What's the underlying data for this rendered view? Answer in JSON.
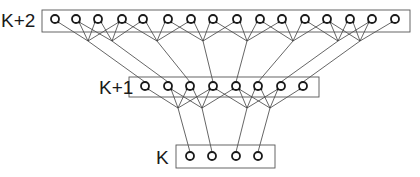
{
  "diagram": {
    "type": "layered-network",
    "layers": [
      {
        "id": "top",
        "label": "K+2",
        "label_pos": [
          1,
          27
        ],
        "box": [
          42,
          10,
          368,
          22
        ],
        "node_y": 19,
        "nodes_x": [
          55,
          76,
          98,
          122,
          143,
          168,
          191,
          213,
          237,
          260,
          282,
          305,
          327,
          350,
          372,
          395
        ]
      },
      {
        "id": "middle",
        "label": "K+1",
        "label_pos": [
          99,
          94
        ],
        "box": [
          129,
          77,
          190,
          20
        ],
        "node_y": 86,
        "nodes_x": [
          145,
          168,
          190,
          213,
          236,
          258,
          281,
          303
        ]
      },
      {
        "id": "bottom",
        "label": "K",
        "label_pos": [
          156,
          164
        ],
        "box": [
          176,
          145,
          99,
          23
        ],
        "node_y": 156,
        "nodes_x": [
          190,
          212,
          236,
          258
        ]
      }
    ],
    "hubs_upper": {
      "y": 41,
      "points": [
        {
          "x": 88,
          "sources": [
            0,
            1,
            2,
            3
          ],
          "target": 0
        },
        {
          "x": 112,
          "sources": [
            1,
            2,
            3,
            4
          ],
          "target": 1
        },
        {
          "x": 157,
          "sources": [
            3,
            4,
            5,
            6
          ],
          "target": 2
        },
        {
          "x": 203,
          "sources": [
            5,
            6,
            7,
            8
          ],
          "target": 3
        },
        {
          "x": 247,
          "sources": [
            7,
            8,
            9,
            10
          ],
          "target": 4
        },
        {
          "x": 293,
          "sources": [
            9,
            10,
            11,
            12
          ],
          "target": 5
        },
        {
          "x": 338,
          "sources": [
            11,
            12,
            13,
            14
          ],
          "target": 6
        },
        {
          "x": 360,
          "sources": [
            12,
            13,
            14,
            15
          ],
          "target": 7
        }
      ]
    },
    "hubs_lower": {
      "y": 108,
      "points": [
        {
          "x": 178,
          "sources": [
            0,
            1,
            2,
            3
          ],
          "target": 0
        },
        {
          "x": 202,
          "sources": [
            1,
            2,
            3,
            4
          ],
          "target": 1
        },
        {
          "x": 247,
          "sources": [
            3,
            4,
            5,
            6
          ],
          "target": 2
        },
        {
          "x": 270,
          "sources": [
            4,
            5,
            6,
            7
          ],
          "target": 3
        }
      ]
    },
    "colors": {
      "stroke": "#1a1a1a",
      "box": "#555555",
      "background": "#ffffff"
    }
  }
}
